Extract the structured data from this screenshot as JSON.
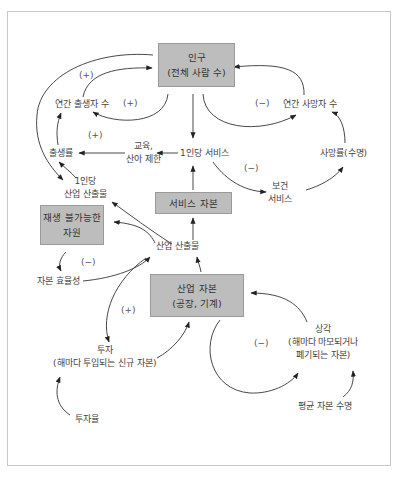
{
  "diagram": {
    "stocks": {
      "population": {
        "line1": "인구",
        "line2": "(전체 사람 수)"
      },
      "service_capital": {
        "line1": "서비스 자본"
      },
      "nonrenewable": {
        "line1": "재생 불가능한",
        "line2": "자원"
      },
      "industrial_capital": {
        "line1": "산업 자본",
        "line2": "(공장, 기계)"
      }
    },
    "variables": {
      "births_per_year": "연간 출생자 수",
      "deaths_per_year": "연간 사망자 수",
      "birth_rate": "출생률",
      "education": {
        "line1": "교육,",
        "line2": "산아 제한"
      },
      "services_per_capita": "1인당 서비스",
      "death_rate": "사망률(수명)",
      "health_services": {
        "line1": "보건",
        "line2": "서비스"
      },
      "industrial_output_per_capita": {
        "line1": "1인당",
        "line2": "산업 산출물"
      },
      "industrial_output": "산업 산출물",
      "capital_efficiency": "자본 효율성",
      "investment": {
        "line1": "투자",
        "line2": "(해마다 투입되는 신규 자본)"
      },
      "investment_rate": "투자율",
      "depreciation": {
        "line1": "상각",
        "line2": "(해마다 마모되거나",
        "line3": "폐기되는 자본)"
      },
      "average_capital_lifetime": "평균 자본 수명"
    },
    "loop_signs": {
      "births_outer": "(+)",
      "births_inner": "(+)",
      "birth_rate_loop": "(+)",
      "deaths": "(−)",
      "health": "(−)",
      "resources": "(−)",
      "investment": "(+)",
      "depreciation": "(−)"
    },
    "colors": {
      "stock_fill": "#bdbdbd",
      "stock_border": "#9a9a9a",
      "arrow": "#222222",
      "text": "#444444",
      "frame": "#c8c8c8"
    }
  }
}
